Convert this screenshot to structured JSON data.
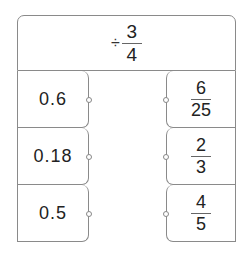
{
  "header": {
    "operator": "÷",
    "operand": {
      "numerator": "3",
      "denominator": "4"
    }
  },
  "left_column": [
    {
      "value": "0.6"
    },
    {
      "value": "0.18"
    },
    {
      "value": "0.5"
    }
  ],
  "right_column": [
    {
      "numerator": "6",
      "denominator": "25"
    },
    {
      "numerator": "2",
      "denominator": "3"
    },
    {
      "numerator": "4",
      "denominator": "5"
    }
  ],
  "colors": {
    "border": "#8a8a8a",
    "text": "#222222"
  }
}
